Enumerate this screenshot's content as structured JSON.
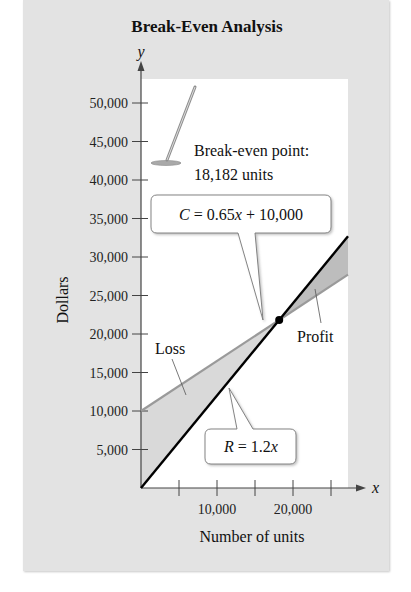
{
  "chart_data": {
    "type": "line",
    "title": "Break-Even Analysis",
    "xlabel": "Number of units",
    "ylabel": "Dollars",
    "x_axis_symbol": "x",
    "y_axis_symbol": "y",
    "xlim": [
      0,
      27500
    ],
    "ylim": [
      0,
      52000
    ],
    "x_ticks": [
      5000,
      10000,
      15000,
      20000,
      25000
    ],
    "x_tick_labels": {
      "10000": "10,000",
      "20000": "20,000"
    },
    "y_ticks": [
      5000,
      10000,
      15000,
      20000,
      25000,
      30000,
      35000,
      40000,
      45000,
      50000
    ],
    "y_tick_labels": [
      "5,000",
      "10,000",
      "15,000",
      "20,000",
      "25,000",
      "30,000",
      "35,000",
      "40,000",
      "45,000",
      "50,000"
    ],
    "grid": false,
    "series": [
      {
        "name": "C = 0.65x + 10,000",
        "kind": "cost",
        "slope": 0.65,
        "intercept": 10000,
        "x": [
          0,
          27237
        ],
        "y": [
          10000,
          27704
        ],
        "color": "#9a9a9a"
      },
      {
        "name": "R = 1.2x",
        "kind": "revenue",
        "slope": 1.2,
        "intercept": 0,
        "x": [
          0,
          27237
        ],
        "y": [
          0,
          32684
        ],
        "color": "#000000"
      }
    ],
    "regions": [
      {
        "label": "Loss",
        "from_x": 0,
        "to_x": 18182,
        "fill": "#d9d9d9"
      },
      {
        "label": "Profit",
        "from_x": 18182,
        "to_x": 27237,
        "fill": "#bdbdbd"
      }
    ],
    "break_even": {
      "x": 18182,
      "y": 21818,
      "label_line1": "Break-even point:",
      "label_line2": "18,182 units"
    }
  },
  "callouts": {
    "cost_equation": {
      "var": "C",
      "rest": " = 0.65",
      "x": "x",
      "tail": " + 10,000"
    },
    "revenue_equation": {
      "var": "R",
      "rest": " = 1.2",
      "x": "x"
    },
    "loss": "Loss",
    "profit": "Profit"
  },
  "colors": {
    "panel": "#e3e3e3",
    "plot_bg": "#ffffff",
    "cost_line": "#9a9a9a",
    "revenue_line": "#000000",
    "loss_fill": "#d9d9d9",
    "profit_fill": "#bdbdbd"
  }
}
